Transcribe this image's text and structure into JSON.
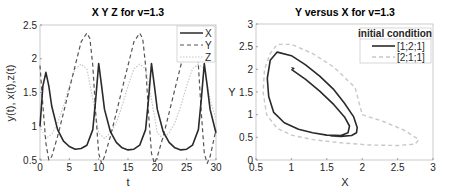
{
  "chart_data": [
    {
      "type": "line",
      "title": "X Y Z for v=1.3",
      "xlabel": "t",
      "ylabel": "y(t), x(t),z(t)",
      "xlim": [
        0,
        30
      ],
      "ylim": [
        0.5,
        2.5
      ],
      "xticks": [
        "0",
        "5",
        "10",
        "15",
        "20",
        "25",
        "30"
      ],
      "yticks": [
        "0.5",
        "1",
        "1.5",
        "2",
        "2.5"
      ],
      "grid": false,
      "legend_position": "upper right",
      "series": [
        {
          "name": "X",
          "style": "solid",
          "color": "#2a2a2a",
          "x": [
            0,
            0.5,
            1,
            1.5,
            2,
            3,
            4,
            5,
            6,
            7,
            8,
            9,
            9.5,
            10,
            10.5,
            11,
            12,
            13,
            14,
            15,
            16,
            17,
            18,
            18.5,
            19,
            19.5,
            20,
            21,
            22,
            23,
            24,
            25,
            26,
            27,
            27.5,
            28,
            28.5,
            29,
            30
          ],
          "y": [
            1.0,
            1.6,
            1.8,
            1.6,
            1.3,
            0.95,
            0.78,
            0.7,
            0.66,
            0.67,
            0.72,
            0.95,
            1.4,
            1.93,
            1.6,
            1.25,
            0.92,
            0.76,
            0.68,
            0.65,
            0.66,
            0.72,
            0.95,
            1.4,
            1.93,
            1.6,
            1.25,
            0.92,
            0.76,
            0.68,
            0.65,
            0.66,
            0.72,
            0.95,
            1.4,
            1.93,
            1.6,
            1.25,
            0.9
          ]
        },
        {
          "name": "Y",
          "style": "dashed",
          "color": "#555555",
          "x": [
            0,
            0.5,
            1,
            1.5,
            2,
            3,
            4,
            5,
            6,
            7,
            8,
            8.5,
            9,
            9.5,
            10,
            10.5,
            11,
            12,
            13,
            14,
            15,
            16,
            17,
            17.5,
            18,
            18.5,
            19,
            19.5,
            20,
            21,
            22,
            23,
            24,
            25,
            26,
            26.5,
            27,
            27.5,
            28,
            28.5,
            29,
            30
          ],
          "y": [
            1.9,
            1.3,
            0.75,
            0.5,
            0.55,
            0.85,
            1.2,
            1.55,
            1.9,
            2.25,
            2.38,
            2.3,
            1.9,
            1.2,
            0.6,
            0.45,
            0.55,
            0.85,
            1.2,
            1.55,
            1.9,
            2.25,
            2.38,
            2.3,
            1.9,
            1.2,
            0.6,
            0.45,
            0.55,
            0.85,
            1.2,
            1.55,
            1.9,
            2.25,
            2.38,
            2.3,
            1.9,
            1.2,
            0.6,
            0.45,
            0.55,
            0.95
          ]
        },
        {
          "name": "Z",
          "style": "dotted",
          "color": "#c8c8c8",
          "x": [
            0,
            1,
            2,
            3,
            4,
            5,
            6,
            7,
            8,
            9,
            10,
            11,
            12,
            13,
            14,
            15,
            16,
            17,
            18,
            19,
            20,
            21,
            22,
            23,
            24,
            25,
            26,
            27,
            28,
            29,
            30
          ],
          "y": [
            1.0,
            0.82,
            0.88,
            1.05,
            1.3,
            1.6,
            1.85,
            1.92,
            1.85,
            1.4,
            0.9,
            0.82,
            0.9,
            1.05,
            1.3,
            1.6,
            1.85,
            1.92,
            1.85,
            1.4,
            0.9,
            0.82,
            0.9,
            1.05,
            1.3,
            1.6,
            1.85,
            1.92,
            1.85,
            1.4,
            1.1
          ]
        }
      ]
    },
    {
      "type": "line",
      "title": "Y versus X for v=1.3",
      "xlabel": "X",
      "ylabel": "Y",
      "xlim": [
        0.5,
        3
      ],
      "ylim": [
        0,
        3
      ],
      "xticks": [
        "0.5",
        "1",
        "1.5",
        "2",
        "2.5",
        "3"
      ],
      "yticks": [
        "0",
        "0.5",
        "1",
        "1.5",
        "2",
        "2.5",
        "3"
      ],
      "grid": false,
      "legend_title": "initial condition",
      "legend_position": "upper right",
      "series": [
        {
          "name": "[1;2;1]",
          "style": "solid",
          "color": "#2a2a2a",
          "x": [
            1.0,
            1.2,
            1.4,
            1.6,
            1.75,
            1.82,
            1.8,
            1.7,
            1.5,
            1.3,
            1.1,
            0.9,
            0.75,
            0.68,
            0.66,
            0.7,
            0.8,
            1.0,
            1.2,
            1.4,
            1.6,
            1.75,
            1.88,
            1.93,
            1.92,
            1.85,
            1.7,
            1.55
          ],
          "y": [
            2.0,
            1.78,
            1.52,
            1.22,
            0.95,
            0.75,
            0.6,
            0.54,
            0.55,
            0.6,
            0.68,
            0.82,
            1.05,
            1.4,
            1.8,
            2.2,
            2.38,
            2.3,
            2.1,
            1.85,
            1.55,
            1.25,
            0.95,
            0.72,
            0.6,
            0.54,
            0.52,
            0.53
          ]
        },
        {
          "name": "[2;1;1]",
          "style": "dashed",
          "color": "#c8c8c8",
          "x": [
            2.0,
            2.3,
            2.6,
            2.8,
            2.75,
            2.5,
            2.1,
            1.7,
            1.3,
            1.0,
            0.8,
            0.65,
            0.6,
            0.62,
            0.7,
            0.8,
            1.0,
            1.3,
            1.6,
            1.9,
            2.0
          ],
          "y": [
            1.0,
            0.85,
            0.65,
            0.45,
            0.35,
            0.32,
            0.33,
            0.38,
            0.45,
            0.55,
            0.7,
            1.0,
            1.5,
            2.0,
            2.35,
            2.55,
            2.55,
            2.35,
            2.05,
            1.6,
            1.0
          ]
        }
      ]
    }
  ]
}
